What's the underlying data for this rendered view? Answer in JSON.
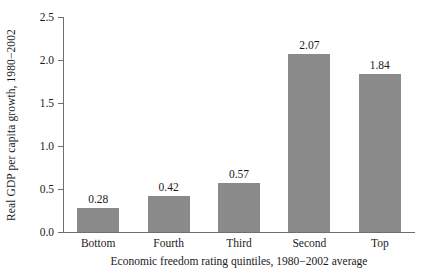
{
  "chart_data": {
    "type": "bar",
    "title": "",
    "subtitle": "",
    "categories": [
      "Bottom",
      "Fourth",
      "Third",
      "Second",
      "Top"
    ],
    "values": [
      0.28,
      0.42,
      0.57,
      2.07,
      1.84
    ],
    "value_labels": [
      "0.28",
      "0.42",
      "0.57",
      "2.07",
      "1.84"
    ],
    "xlabel": "Economic freedom rating quintiles, 1980−2002 average",
    "ylabel": "Real GDP per capita growth, 1980−2002",
    "ylim": [
      0.0,
      2.5
    ],
    "ytick_labels": [
      "0.0",
      "0.5",
      "1.0",
      "1.5",
      "2.0",
      "2.5"
    ],
    "ytick_values": [
      0.0,
      0.5,
      1.0,
      1.5,
      2.0,
      2.5
    ],
    "grid": false,
    "legend": null,
    "bar_color": "#8a8a8a",
    "axis_color": "#6e6e6e",
    "background": "#ffffff",
    "text_color": "#1a1a1a"
  }
}
